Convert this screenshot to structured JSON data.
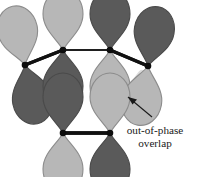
{
  "figure": {
    "type": "molecular-orbital-diagram",
    "background_color": "#ffffff",
    "colors": {
      "lobe_dark": "#5a5a5a",
      "lobe_light": "#b7b7b7",
      "lobe_outline": "#6f6f6f",
      "bond": "#111111",
      "node": "#0d0d0d",
      "overlap_band": "#d9d9d9",
      "arrow": "#1a1a1a",
      "text": "#1a1a1a"
    }
  },
  "annotation": {
    "line1": "out-of-phase",
    "line2": "overlap",
    "arrow_name": "annotation-arrow"
  },
  "orbitals": [
    {
      "id": "orbital-top-1",
      "label": "p orbital 1",
      "cx": 25,
      "cy": 65,
      "tilt": -12,
      "top_phase": "light",
      "bottom_phase": "dark"
    },
    {
      "id": "orbital-top-2",
      "label": "p orbital 2",
      "cx": 63,
      "cy": 50,
      "tilt": 0,
      "top_phase": "light",
      "bottom_phase": "dark"
    },
    {
      "id": "orbital-top-3",
      "label": "p orbital 3",
      "cx": 110,
      "cy": 50,
      "tilt": 0,
      "top_phase": "dark",
      "bottom_phase": "light"
    },
    {
      "id": "orbital-top-4",
      "label": "p orbital 4",
      "cx": 148,
      "cy": 66,
      "tilt": 10,
      "top_phase": "dark",
      "bottom_phase": "light"
    },
    {
      "id": "orbital-bottom-1",
      "label": "p orbital 5",
      "cx": 63,
      "cy": 133,
      "tilt": 0,
      "top_phase": "dark",
      "bottom_phase": "light"
    },
    {
      "id": "orbital-bottom-2",
      "label": "p orbital 6",
      "cx": 110,
      "cy": 133,
      "tilt": 0,
      "top_phase": "light",
      "bottom_phase": "dark"
    }
  ],
  "bonds": [
    {
      "id": "bond-1-2",
      "x1": 25,
      "y1": 65,
      "x2": 63,
      "y2": 50,
      "width": 3.1
    },
    {
      "id": "bond-2-3",
      "x1": 63,
      "y1": 50,
      "x2": 110,
      "y2": 50,
      "width": 1.5
    },
    {
      "id": "bond-3-4",
      "x1": 110,
      "y1": 50,
      "x2": 148,
      "y2": 66,
      "width": 3.1
    },
    {
      "id": "bond-5-6",
      "x1": 63,
      "y1": 133,
      "x2": 110,
      "y2": 133,
      "width": 3.4
    }
  ],
  "overlap_bands": [
    {
      "id": "overlap-band-left",
      "x1": 31,
      "y1": 94,
      "x2": 62,
      "y2": 108,
      "width": 7
    },
    {
      "id": "overlap-band-right",
      "x1": 142,
      "y1": 74,
      "x2": 112,
      "y2": 114,
      "width": 8
    }
  ],
  "nodes": [
    {
      "id": "node-1",
      "cx": 25,
      "cy": 65
    },
    {
      "id": "node-2",
      "cx": 63,
      "cy": 50
    },
    {
      "id": "node-3",
      "cx": 110,
      "cy": 50
    },
    {
      "id": "node-4",
      "cx": 148,
      "cy": 66
    },
    {
      "id": "node-5",
      "cx": 63,
      "cy": 133
    },
    {
      "id": "node-6",
      "cx": 110,
      "cy": 133
    }
  ]
}
